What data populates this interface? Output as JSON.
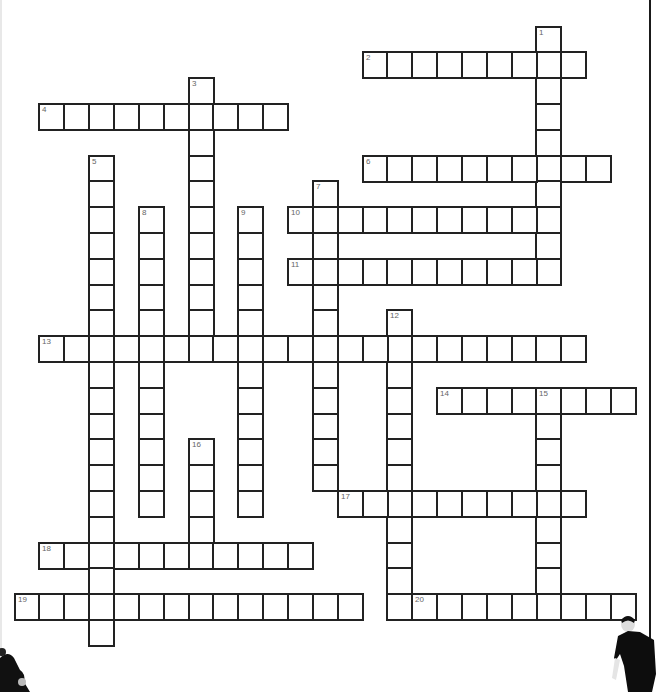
{
  "puzzle": {
    "type": "crossword",
    "grid": {
      "origin_x": 13.6,
      "origin_y": 25.5,
      "cell_w": 24.85,
      "cell_h": 25.8
    },
    "words": [
      {
        "number": "1",
        "direction": "down",
        "row": 0,
        "col": 21,
        "length": 10
      },
      {
        "number": "2",
        "direction": "across",
        "row": 1,
        "col": 14,
        "length": 9
      },
      {
        "number": "3",
        "direction": "down",
        "row": 2,
        "col": 7,
        "length": 11
      },
      {
        "number": "4",
        "direction": "across",
        "row": 3,
        "col": 1,
        "length": 10
      },
      {
        "number": "5",
        "direction": "down",
        "row": 5,
        "col": 3,
        "length": 19
      },
      {
        "number": "6",
        "direction": "across",
        "row": 5,
        "col": 14,
        "length": 10
      },
      {
        "number": "7",
        "direction": "down",
        "row": 6,
        "col": 12,
        "length": 12
      },
      {
        "number": "8",
        "direction": "down",
        "row": 7,
        "col": 5,
        "length": 12
      },
      {
        "number": "9",
        "direction": "down",
        "row": 7,
        "col": 9,
        "length": 12
      },
      {
        "number": "10",
        "direction": "across",
        "row": 7,
        "col": 11,
        "length": 11
      },
      {
        "number": "11",
        "direction": "across",
        "row": 9,
        "col": 11,
        "length": 11
      },
      {
        "number": "12",
        "direction": "down",
        "row": 11,
        "col": 15,
        "length": 12
      },
      {
        "number": "13",
        "direction": "across",
        "row": 12,
        "col": 1,
        "length": 22
      },
      {
        "number": "14",
        "direction": "across",
        "row": 14,
        "col": 17,
        "length": 8
      },
      {
        "number": "15",
        "direction": "down",
        "row": 14,
        "col": 21,
        "length": 9
      },
      {
        "number": "16",
        "direction": "down",
        "row": 16,
        "col": 7,
        "length": 5
      },
      {
        "number": "17",
        "direction": "across",
        "row": 18,
        "col": 13,
        "length": 10
      },
      {
        "number": "18",
        "direction": "across",
        "row": 20,
        "col": 1,
        "length": 11
      },
      {
        "number": "19",
        "direction": "across",
        "row": 22,
        "col": 0,
        "length": 14
      },
      {
        "number": "20",
        "direction": "across",
        "row": 22,
        "col": 16,
        "length": 9
      }
    ]
  },
  "decorations": {
    "left_figure": "person-silhouette-partial",
    "right_figure": "person-in-black-shirt"
  },
  "colors": {
    "cell_border": "#222222",
    "number_text": "#666666",
    "background": "#ffffff"
  }
}
